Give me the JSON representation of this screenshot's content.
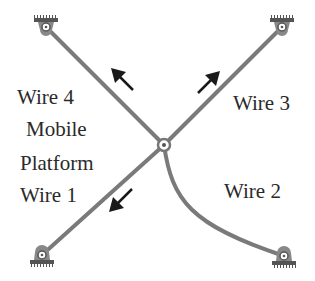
{
  "diagram": {
    "type": "cable-driven parallel mechanism",
    "colors": {
      "wire": "#7a7a7a",
      "arrow": "#1a1a1a",
      "text": "#2a2a2a",
      "background": "#ffffff"
    },
    "labels": {
      "wire4": "Wire 4",
      "mobile": "Mobile",
      "platform": "Platform",
      "wire1": "Wire 1",
      "wire3": "Wire 3",
      "wire2": "Wire 2"
    },
    "nodes": [
      {
        "id": "anchor-top-left",
        "x": 46,
        "y": 27
      },
      {
        "id": "anchor-top-right",
        "x": 282,
        "y": 27
      },
      {
        "id": "mobile-platform",
        "x": 164,
        "y": 145
      },
      {
        "id": "anchor-bottom-left",
        "x": 42,
        "y": 255
      },
      {
        "id": "anchor-bottom-right",
        "x": 284,
        "y": 256
      }
    ],
    "edges": [
      {
        "wire": "Wire 4",
        "from": "mobile-platform",
        "to": "anchor-top-left",
        "shape": "straight",
        "force_arrow": "toward anchor (up-left)"
      },
      {
        "wire": "Wire 3",
        "from": "mobile-platform",
        "to": "anchor-top-right",
        "shape": "straight",
        "force_arrow": "toward anchor (up-right)"
      },
      {
        "wire": "Wire 1",
        "from": "mobile-platform",
        "to": "anchor-bottom-left",
        "shape": "straight",
        "force_arrow": "toward anchor (down-left)"
      },
      {
        "wire": "Wire 2",
        "from": "mobile-platform",
        "to": "anchor-bottom-right",
        "shape": "curved (slack)",
        "force_arrow": "none"
      }
    ]
  }
}
